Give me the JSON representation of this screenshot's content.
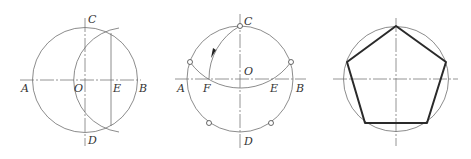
{
  "figures": [
    {
      "id": "figure-1",
      "description": "Circle with center O, bisect OB at E using arc",
      "labels": {
        "A": "A",
        "B": "B",
        "C": "C",
        "D": "D",
        "O": "O",
        "E": "E"
      }
    },
    {
      "id": "figure-2",
      "description": "Arc from C centered at E locates F; chord CF sets side length, five division points marked",
      "labels": {
        "A": "A",
        "B": "B",
        "C": "C",
        "D": "D",
        "O": "O",
        "E": "E",
        "F": "F"
      }
    },
    {
      "id": "figure-3",
      "description": "Regular pentagon inscribed in circle",
      "labels": {}
    }
  ],
  "colors": {
    "line": "#6f6f6f",
    "bold": "#2a2a2a",
    "text": "#333333",
    "background": "#ffffff"
  }
}
